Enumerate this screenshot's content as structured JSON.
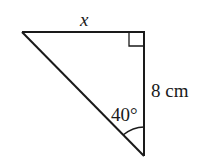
{
  "diagram": {
    "type": "right-triangle",
    "colors": {
      "stroke": "#1a1a1a",
      "background": "#ffffff"
    },
    "vertices": {
      "top_left": [
        22,
        32
      ],
      "right_angle": [
        144,
        32
      ],
      "bottom": [
        144,
        156
      ]
    },
    "labels": {
      "top_side": "x",
      "right_side": "8 cm",
      "angle": "40°"
    },
    "right_angle_marker": true,
    "angle_arc_at": "bottom"
  }
}
